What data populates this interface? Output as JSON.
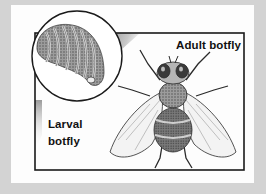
{
  "figure": {
    "labels": {
      "adult": "Adult botfly",
      "larval_line1": "Larval",
      "larval_line2": "botfly"
    }
  },
  "colors": {
    "background": "#d3d3d3",
    "card": "#fdfdfd",
    "outline": "#1a1a1a",
    "shadow": "#9a9a9a"
  }
}
